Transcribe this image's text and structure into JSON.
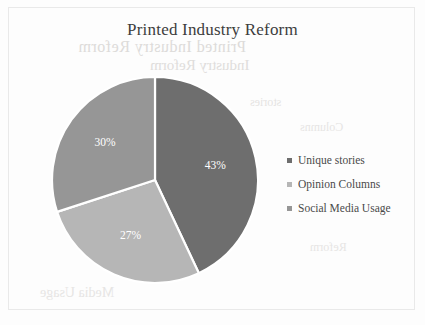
{
  "chart_data": {
    "type": "pie",
    "title": "Printed Industry Reform",
    "categories": [
      "Unique stories",
      "Opinion Columns",
      "Social Media Usage"
    ],
    "values": [
      43,
      27,
      30
    ],
    "value_labels": [
      "43%",
      "27%",
      "30%"
    ],
    "colors": [
      "#6e6e6e",
      "#b6b6b6",
      "#969696"
    ],
    "legend_position": "right",
    "grid": false,
    "start_angle_deg": 0,
    "direction": "clockwise",
    "separator_color": "#ffffff",
    "label_color": "#ffffff"
  },
  "frame": {
    "border_color": "#e9e9e9",
    "background": "#fdfdfd"
  },
  "title": {
    "text": "Printed Industry Reform",
    "color": "#3d3d3d"
  },
  "slices": [
    {
      "label": "43%",
      "name": "Unique stories",
      "value": 43,
      "color": "#6e6e6e"
    },
    {
      "label": "27%",
      "name": "Opinion Columns",
      "value": 27,
      "color": "#b6b6b6"
    },
    {
      "label": "30%",
      "name": "Social Media Usage",
      "value": 30,
      "color": "#969696"
    }
  ],
  "legend": {
    "items": [
      {
        "label": "Unique stories",
        "color": "#6e6e6e"
      },
      {
        "label": "Opinion Columns",
        "color": "#b6b6b6"
      },
      {
        "label": "Social Media Usage",
        "color": "#969696"
      }
    ]
  },
  "background_artifacts": {
    "line1": "Printed Industry Reform",
    "line2": "Industry Reform",
    "line3": "stories",
    "line4": "Columns",
    "line5": "Media Usage",
    "line6": "Reform"
  }
}
